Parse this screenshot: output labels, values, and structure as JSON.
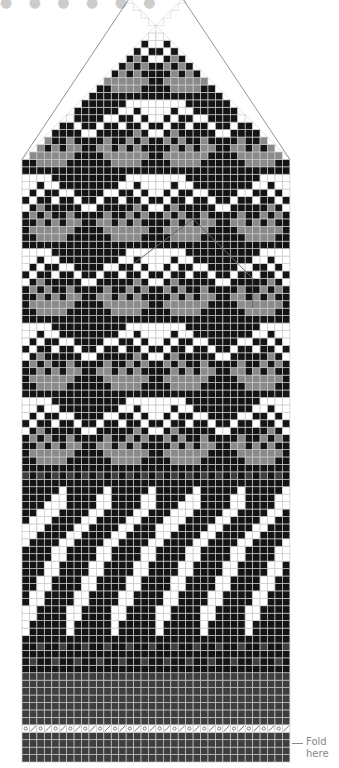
{
  "title_fragment": "● ● ● ●  ● ●",
  "fold_label": {
    "line1": "Fold",
    "line2": "here"
  },
  "colors": {
    "black": "#141414",
    "grey": "#8a8a8a",
    "white": "#ffffff",
    "dark": "#3e3e3e",
    "grid": "#c9c9c9",
    "outline": "#777777"
  },
  "grid": {
    "left": 22,
    "bottom": 762,
    "cell": 7.44,
    "cols": 36
  },
  "legend": {
    "K": "black",
    "G": "grey",
    "W": "white",
    "D": "dark grey",
    "O": "yarn over",
    "S": "k2tog"
  },
  "rows_bottom_to_top": [
    "DDDDDDDDDDDDDDDDDD",
    "DDDDDDDDDDDDDDDDDD",
    "DDDDDDDDDDDDDDDDDD",
    "DDDDDDDDDDDDDDDDDD",
    "OSOSOSOSOSOSOSOSOS",
    "DDDDDDDDDDDDDDDDDD",
    "DDDDDDDDDDDDDDDDDD",
    "DDDDDDDDDDDDDDDDDD",
    "DDDDDDDDDDDDDDDDDD",
    "DDDDDDDDDDDDDDDDDD",
    "DDDDDDDDDDDDDDDDDD",
    "DDDDDDDDDDDDDDDDDD",
    "KKKKKKKKKKKKKKKKKK",
    "KDKKDKKDKKDKKDKKDK",
    "KKKKKKKKKKKKKKKKKK",
    "KKDKKDKKDKKDKKDKKD",
    "KKKKKKKKKKKKKKKKKK",
    "WKKKKKWKKKKKWKKKKK",
    "WKKKKKWKKKKKWKKKKK",
    "WWKKKKWWKKKKWWKKKK",
    "WWKKKKWWKKKKWWKKKK",
    "KWWKKKKWWKKKKWWKKK",
    "KWWKKKKWWKKKKWWKKK",
    "KKWWKKKKWWKKKKWWKK",
    "KKWWKKKKWWKKKKWWKK",
    "KKKWWKKKKWWKKKKWWK",
    "KKKWWKKKKWWKKKKWWK",
    "KKKKWWKKKKWWKKKKWW",
    "KKKKWWKKKKWWKKKKWW",
    "WKKKKWWKKKKWWKKKKW",
    "WWKKKKWWKKKKWWKKKK",
    "WWWKKKKWWKKKKWWKKK",
    "KWWWKKKKWWKKKKWWKK",
    "KKWWWKKKKWWKKKKWWK",
    "KKKWWWKKKKWWKKKKWW",
    "KKKKWWKKKKWWKKKKWW",
    "KKKKKWKKKKKWKKKKKW",
    "KKKKKKKKKKKKKKKKKK",
    "DKDKDKDKDKDKDKDKDK",
    "KKKKKKKKKKKKKKKKKK",
    "KKGGGGKKKKKKGGGGKK",
    "KGGGGGGKKKKGGGGGGK",
    "KKGKGKGGKKGGKGKGKK",
    "KGKGKKGKKKKGKKGKGK",
    "WKGKKKKKWWKKKKKGKW",
    "KWKKWKKWKKWKKWKKWK",
    "WKWKKWWKKKKWWKKWKW",
    "WWKWWKKKKKKKKWWKWW",
    "WWWWKKKKKKKKKKWWWW",
    "KKKKKKKKKKKKKKKKKK",
    "KKGGGGKKKKKKGGGGKK",
    "KGGGGGGKKKKGGGGGGK",
    "KKGKGKGGKKGGKGKGKK",
    "KGKGKKGKKKKGKKGKGK",
    "WKGKKKKKWWKKKKKGKW",
    "KWKKWKKWKKWKKWKKWK",
    "WKWKKWWKKKKWWKKWKW",
    "WWKWWKKKKKKKKWWKWW",
    "WWWWKKKKKKKKKKWWWW",
    "KKKKKKKKKKKKKKKKKK",
    "KKGGGGKKKKKKGGGGKK",
    "KGGGGGGKKKKGGGGGGK",
    "KKGKGKGGKKGGKGKGKK",
    "KGKGKKGKKKKGKKGKGK",
    "WKGKKKKKWWKKKKKGKW",
    "KWKKWKKWKKWKKWKKWK",
    "WKWKKWWKKKKWWKKWKW",
    "WWKWWKKKKKKKKWWKWW",
    "WWWWKKKKKKKKKKWWWW",
    "KKKKKKKKKKKKKKKKKK",
    "KKGGGGKKKKKKGGGGKK",
    "KGGGGGGKKKKGGGGGGK",
    "KKGKGKGGKKGGKGKGKK",
    "KGKGKKGKKKKGKKGKGK",
    "WKGKKKKKWWKKKKKGKW",
    "KWKKWKKWKKWKKWKKWK",
    "WKWKKWWKKKKWWKKWKW",
    "WWKWWKKKKKKKKWWKWW",
    "WWWWKKKKKKKKKKWWWW",
    "KKKKKKKKKKKKKKKKKK",
    "KKGGGGKKKKKKGGGGKK",
    "KGGGGGGKKKKGGGGGGK",
    "KKGKGKGGKKGGKGKGKK",
    "KGKGKKGKKKKGKKGKGK",
    "WKGKKKKKWWKKKKKGKW",
    "KWKKWKKWKKWKKWKKWK",
    "WKWKKWWKKKKWWKKWKW",
    "WWKWWKKKKKKKKWWKWW",
    "WWWWKKKKKKKKKKWWWW",
    "KKKKKKKKKKKKKKKKKK",
    "KKGGGGKKKKKKGGGGKK",
    "KGGGGGGKKKKGGGGGGK",
    "KKGKGKGGKKGGKGKGKK",
    "KGKGKKGKKKKGKKGKGK",
    "WKGKKKKKWWKKKKKGKW",
    "KWKKWKKWKKWKKWKKWK",
    "WKWKKWWKKKKWWKKWKW",
    "WWKWWKKKKKKKKWWKWW",
    "KKKKKKKKWWKKKKKKKK",
    "KKKKKKKKWWKKKKKKKK",
    "KKKKKKKKKKKKKKKKKK",
    "KKKKKKKKKKKKKKKKKK",
    "KKKKKKKKKKKKKKKKKK",
    "KKKKKKKKKKKKKKKKKK",
    "KKKKKKKKKKKKKKKKKK",
    "KKKKKKKKKKKKKKKKKK",
    "KKKKKKKKKKKKKKKKKK"
  ],
  "decrease_start_row": 81,
  "overlay_outline": {
    "apex_row": 73,
    "apex_col": 23,
    "half_width": 5
  }
}
